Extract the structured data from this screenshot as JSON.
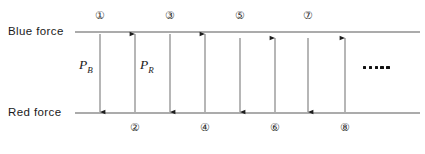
{
  "figure": {
    "type": "diagram",
    "canvas": {
      "width": 425,
      "height": 154,
      "background": "#ffffff"
    },
    "axes": {
      "blue_force": {
        "label": "Blue force",
        "line_color": "#8f8f8f",
        "y": 32,
        "x_start": 75,
        "x_end": 420
      },
      "red_force": {
        "label": "Red force",
        "line_color": "#8f8f8f",
        "y": 113,
        "x_start": 75,
        "x_end": 420
      }
    },
    "force_labels": [
      {
        "name": "blue-force",
        "text": "Blue force",
        "x": 8,
        "y": 26
      },
      {
        "name": "red-force",
        "text": "Red force",
        "x": 8,
        "y": 107
      }
    ],
    "p_labels": [
      {
        "name": "p-b",
        "base": "P",
        "sub": "B",
        "x": 79,
        "y": 60
      },
      {
        "name": "p-r",
        "base": "P",
        "sub": "R",
        "x": 140,
        "y": 60
      }
    ],
    "arrows": [
      {
        "id": 1,
        "marker": "①",
        "x": 100,
        "direction": "down",
        "from_y": 34,
        "to_y": 112,
        "marker_position": "top",
        "marker_x": 100,
        "marker_y": 11,
        "color": "#6d6d6d"
      },
      {
        "id": 2,
        "marker": "②",
        "x": 135,
        "direction": "up",
        "from_y": 112,
        "to_y": 34,
        "marker_position": "bottom",
        "marker_x": 135,
        "marker_y": 122,
        "color": "#6d6d6d"
      },
      {
        "id": 3,
        "marker": "③",
        "x": 170,
        "direction": "down",
        "from_y": 34,
        "to_y": 112,
        "marker_position": "top",
        "marker_x": 170,
        "marker_y": 11,
        "color": "#6d6d6d"
      },
      {
        "id": 4,
        "marker": "④",
        "x": 205,
        "direction": "up",
        "from_y": 112,
        "to_y": 34,
        "marker_position": "bottom",
        "marker_x": 205,
        "marker_y": 122,
        "color": "#6d6d6d"
      },
      {
        "id": 5,
        "marker": "⑤",
        "x": 240,
        "direction": "down",
        "from_y": 38,
        "to_y": 112,
        "marker_position": "top",
        "marker_x": 240,
        "marker_y": 11,
        "color": "#6d6d6d"
      },
      {
        "id": 6,
        "marker": "⑥",
        "x": 275,
        "direction": "up",
        "from_y": 112,
        "to_y": 38,
        "marker_position": "bottom",
        "marker_x": 275,
        "marker_y": 122,
        "color": "#6d6d6d"
      },
      {
        "id": 7,
        "marker": "⑦",
        "x": 308,
        "direction": "down",
        "from_y": 38,
        "to_y": 112,
        "marker_position": "top",
        "marker_x": 308,
        "marker_y": 11,
        "color": "#6d6d6d"
      },
      {
        "id": 8,
        "marker": "⑧",
        "x": 345,
        "direction": "up",
        "from_y": 112,
        "to_y": 38,
        "marker_position": "bottom",
        "marker_x": 345,
        "marker_y": 122,
        "color": "#6d6d6d"
      }
    ],
    "circled_numbers_top": [
      "①",
      "③",
      "⑤",
      "⑦"
    ],
    "circled_numbers_bottom": [
      "②",
      "④",
      "⑥",
      "⑧"
    ],
    "ellipsis": {
      "name": "continuation-ellipsis",
      "dot_count": 5,
      "x": 363,
      "y": 66,
      "color": "#111111"
    }
  }
}
